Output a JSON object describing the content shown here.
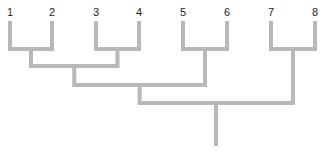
{
  "diagram": {
    "type": "dendrogram",
    "line_color": "#b8b8b8",
    "line_width": 4,
    "label_color": "#222222",
    "leaves": [
      {
        "label": "1",
        "x": 10
      },
      {
        "label": "2",
        "x": 52
      },
      {
        "label": "3",
        "x": 96
      },
      {
        "label": "4",
        "x": 139
      },
      {
        "label": "5",
        "x": 183
      },
      {
        "label": "6",
        "x": 227
      },
      {
        "label": "7",
        "x": 271
      },
      {
        "label": "8",
        "x": 315
      }
    ],
    "merges": [
      {
        "children": [
          "1",
          "2"
        ],
        "y": 49
      },
      {
        "children": [
          "3",
          "4"
        ],
        "y": 49
      },
      {
        "children": [
          "5",
          "6"
        ],
        "y": 49
      },
      {
        "children": [
          "7",
          "8"
        ],
        "y": 49
      },
      {
        "children": [
          "(1,2)",
          "(3,4)"
        ],
        "y": 66
      },
      {
        "children": [
          "((1,2),(3,4))",
          "(5,6)"
        ],
        "y": 85
      },
      {
        "children": [
          "(((1,2),(3,4)),(5,6))",
          "(7,8)"
        ],
        "y": 103
      }
    ],
    "root": {
      "x": 216,
      "y_top": 103,
      "y_bottom": 144
    }
  }
}
